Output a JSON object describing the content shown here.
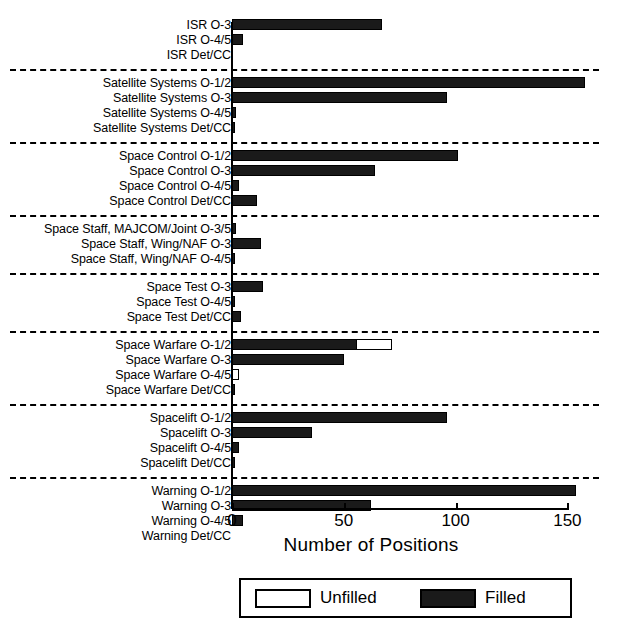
{
  "chart_data": {
    "type": "bar",
    "orientation": "horizontal",
    "title": "",
    "xlabel": "Number of Positions",
    "ylabel": "",
    "xlim": [
      0,
      165
    ],
    "xticks": [
      0,
      50,
      100,
      150
    ],
    "xtick_labels": [
      "0",
      "50",
      "100",
      "150"
    ],
    "grid": false,
    "legend_position": "bottom-center",
    "series": [
      {
        "name": "Unfilled",
        "color": "#ffffff"
      },
      {
        "name": "Filled",
        "color": "#1a1a1a"
      }
    ],
    "groups": [
      {
        "name": "ISR",
        "rows": [
          {
            "label": "ISR O-3",
            "filled": 67,
            "unfilled": 0
          },
          {
            "label": "ISR O-4/5",
            "filled": 5,
            "unfilled": 0
          },
          {
            "label": "ISR Det/CC",
            "filled": 0,
            "unfilled": 0
          }
        ]
      },
      {
        "name": "Satellite Systems",
        "rows": [
          {
            "label": "Satellite Systems O-1/2",
            "filled": 158,
            "unfilled": 0
          },
          {
            "label": "Satellite Systems O-3",
            "filled": 96,
            "unfilled": 0
          },
          {
            "label": "Satellite Systems O-4/5",
            "filled": 2,
            "unfilled": 0
          },
          {
            "label": "Satellite Systems Det/CC",
            "filled": 1,
            "unfilled": 0
          }
        ]
      },
      {
        "name": "Space Control",
        "rows": [
          {
            "label": "Space Control O-1/2",
            "filled": 101,
            "unfilled": 0
          },
          {
            "label": "Space Control O-3",
            "filled": 64,
            "unfilled": 0
          },
          {
            "label": "Space Control O-4/5",
            "filled": 3,
            "unfilled": 0
          },
          {
            "label": "Space Control Det/CC",
            "filled": 11,
            "unfilled": 0
          }
        ]
      },
      {
        "name": "Space Staff",
        "rows": [
          {
            "label": "Space Staff, MAJCOM/Joint O-3/5",
            "filled": 2,
            "unfilled": 0
          },
          {
            "label": "Space Staff, Wing/NAF O-3",
            "filled": 13,
            "unfilled": 0
          },
          {
            "label": "Space Staff, Wing/NAF O-4/5",
            "filled": 1,
            "unfilled": 0
          }
        ]
      },
      {
        "name": "Space Test",
        "rows": [
          {
            "label": "Space Test O-3",
            "filled": 14,
            "unfilled": 0
          },
          {
            "label": "Space Test O-4/5",
            "filled": 1,
            "unfilled": 0
          },
          {
            "label": "Space Test Det/CC",
            "filled": 4,
            "unfilled": 0
          }
        ]
      },
      {
        "name": "Space Warfare",
        "rows": [
          {
            "label": "Space Warfare O-1/2",
            "filled": 56,
            "unfilled": 16
          },
          {
            "label": "Space Warfare O-3",
            "filled": 50,
            "unfilled": 0
          },
          {
            "label": "Space Warfare O-4/5",
            "filled": 0,
            "unfilled": 3
          },
          {
            "label": "Space Warfare Det/CC",
            "filled": 1,
            "unfilled": 0
          }
        ]
      },
      {
        "name": "Spacelift",
        "rows": [
          {
            "label": "Spacelift O-1/2",
            "filled": 96,
            "unfilled": 0
          },
          {
            "label": "Spacelift O-3",
            "filled": 36,
            "unfilled": 0
          },
          {
            "label": "Spacelift O-4/5",
            "filled": 3,
            "unfilled": 0
          },
          {
            "label": "Spacelift Det/CC",
            "filled": 1,
            "unfilled": 0
          }
        ]
      },
      {
        "name": "Warning",
        "rows": [
          {
            "label": "Warning O-1/2",
            "filled": 154,
            "unfilled": 0
          },
          {
            "label": "Warning O-3",
            "filled": 62,
            "unfilled": 0
          },
          {
            "label": "Warning O-4/5",
            "filled": 5,
            "unfilled": 0
          },
          {
            "label": "Warning Det/CC",
            "filled": 0,
            "unfilled": 0
          }
        ]
      }
    ]
  }
}
